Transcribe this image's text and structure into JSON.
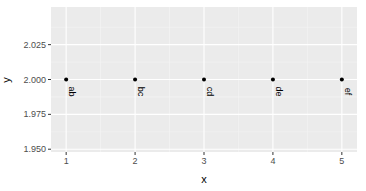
{
  "chart_data": {
    "type": "scatter",
    "title": "",
    "xlabel": "x",
    "ylabel": "y",
    "x": [
      1,
      2,
      3,
      4,
      5
    ],
    "y": [
      2.0,
      2.0,
      2.0,
      2.0,
      2.0
    ],
    "point_labels": [
      "ab",
      "bc",
      "cd",
      "de",
      "ef"
    ],
    "label_rotation": -90,
    "xlim": [
      0.78,
      5.22
    ],
    "ylim": [
      1.948,
      2.052
    ],
    "x_ticks": [
      1,
      2,
      3,
      4,
      5
    ],
    "x_tick_labels": [
      "1",
      "2",
      "3",
      "4",
      "5"
    ],
    "y_ticks": [
      1.95,
      1.975,
      2.0,
      2.025
    ],
    "y_tick_labels": [
      "1.950",
      "1.975",
      "2.000",
      "2.025"
    ],
    "grid": true,
    "legend": null,
    "theme": "ggplot2-grey",
    "colors": {
      "panel_background": "#ebebeb",
      "grid_major": "#ffffff",
      "grid_minor": "#f5f5f5",
      "point": "#000000",
      "tick_label": "#4d4d4d",
      "tick_mark": "#333333"
    }
  }
}
